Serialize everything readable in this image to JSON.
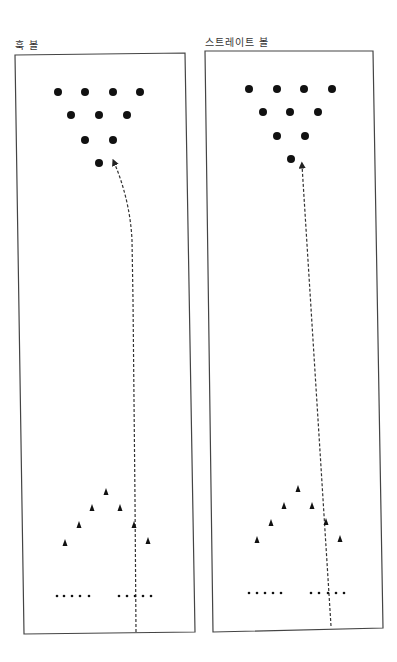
{
  "panels": [
    {
      "id": "hook",
      "label": "훅 볼",
      "label_pos": [
        15,
        41
      ],
      "lane_box": [
        [
          15,
          55
        ],
        [
          185,
          53
        ],
        [
          195,
          632
        ],
        [
          24,
          634
        ]
      ],
      "pins": [
        [
          58,
          92
        ],
        [
          85,
          92
        ],
        [
          113,
          92
        ],
        [
          140,
          92
        ],
        [
          71,
          115
        ],
        [
          99,
          115
        ],
        [
          127,
          115
        ],
        [
          85,
          140
        ],
        [
          113,
          140
        ],
        [
          99,
          163
        ]
      ],
      "arrows": [
        [
          106,
          492
        ],
        [
          92,
          508
        ],
        [
          120,
          508
        ],
        [
          79,
          525
        ],
        [
          134,
          525
        ],
        [
          65,
          543
        ],
        [
          148,
          541
        ]
      ],
      "dots": [
        [
          57,
          596
        ],
        [
          64,
          596
        ],
        [
          72,
          596
        ],
        [
          80,
          596
        ],
        [
          89,
          596
        ],
        [
          119,
          596
        ],
        [
          127,
          596
        ],
        [
          135,
          596
        ],
        [
          143,
          596
        ],
        [
          151,
          596
        ]
      ],
      "path": "M 136 632 L 135 500 L 133 300 L 132 240 Q 130 200 114 162",
      "arrow_tip": [
        113,
        160
      ],
      "path_type": "hook"
    },
    {
      "id": "straight",
      "label": "스트레이트 볼",
      "label_pos": [
        205,
        38
      ],
      "lane_box": [
        [
          205,
          51
        ],
        [
          373,
          51
        ],
        [
          383,
          628
        ],
        [
          213,
          632
        ]
      ],
      "pins": [
        [
          249,
          89
        ],
        [
          277,
          89
        ],
        [
          304,
          89
        ],
        [
          332,
          89
        ],
        [
          263,
          112
        ],
        [
          290,
          112
        ],
        [
          318,
          112
        ],
        [
          277,
          136
        ],
        [
          305,
          136
        ],
        [
          291,
          159
        ]
      ],
      "arrows": [
        [
          298,
          489
        ],
        [
          284,
          506
        ],
        [
          312,
          506
        ],
        [
          271,
          523
        ],
        [
          326,
          522
        ],
        [
          257,
          540
        ],
        [
          340,
          539
        ]
      ],
      "dots": [
        [
          249,
          593
        ],
        [
          257,
          593
        ],
        [
          265,
          593
        ],
        [
          273,
          593
        ],
        [
          281,
          593
        ],
        [
          311,
          593
        ],
        [
          319,
          593
        ],
        [
          328,
          593
        ],
        [
          336,
          593
        ],
        [
          344,
          593
        ]
      ],
      "path": "M 331 626 L 302 165",
      "arrow_tip": [
        302,
        163
      ],
      "path_type": "straight"
    }
  ],
  "colors": {
    "ink": "#111111",
    "lane_border": "#444444",
    "path": "#333333"
  }
}
